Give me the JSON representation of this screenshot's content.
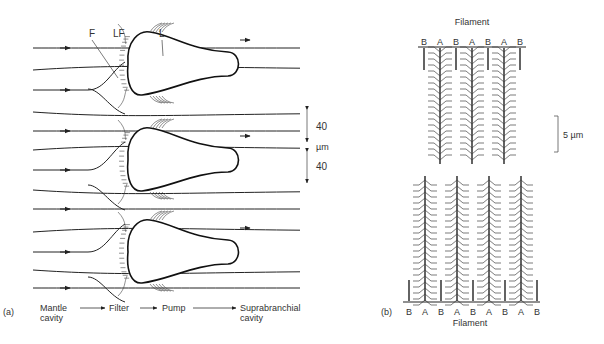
{
  "panel_a": {
    "panel_label": "(a)",
    "labels": {
      "F": "F",
      "LF": "LF",
      "L": "L"
    },
    "scale": {
      "upper": "40",
      "unit": "µm",
      "lower": "40"
    },
    "flow_sequence": {
      "step1_line1": "Mantle",
      "step1_line2": "cavity",
      "step2": "Filter",
      "step3": "Pump",
      "step4_line1": "Suprabranchial",
      "step4_line2": "cavity"
    },
    "filament_count": 3
  },
  "panel_b": {
    "panel_label": "(b)",
    "top_title": "Filament",
    "bottom_title": "Filament",
    "top_letters": [
      "B",
      "A",
      "B",
      "A",
      "B",
      "A",
      "B"
    ],
    "bottom_letters": [
      "B",
      "A",
      "B",
      "A",
      "B",
      "A",
      "B",
      "A",
      "B"
    ],
    "scale_bar": "5 µm"
  }
}
